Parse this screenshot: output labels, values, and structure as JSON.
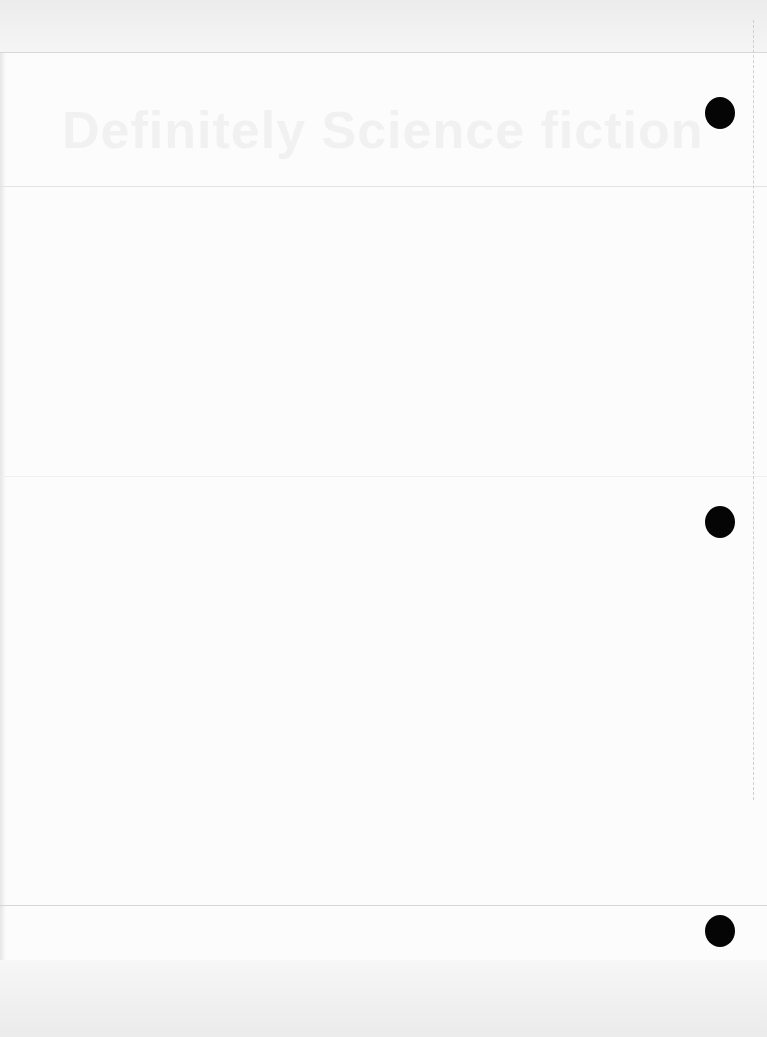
{
  "page": {
    "type": "scanned-blank-page",
    "background_color": "#fcfcfc",
    "heading": "Definitely Science fiction",
    "punch_holes": [
      {
        "position": "top",
        "color": "#050505"
      },
      {
        "position": "middle",
        "color": "#050505"
      },
      {
        "position": "bottom",
        "color": "#050505"
      }
    ],
    "rules": [
      "top-band",
      "header-rule",
      "middle-rule",
      "footer-rule"
    ]
  }
}
